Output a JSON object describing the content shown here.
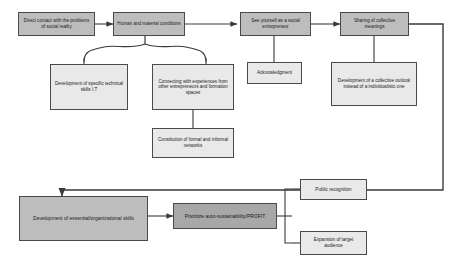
{
  "diagram": {
    "type": "flowchart",
    "colors": {
      "box_fill_gray": "#bdbdbd",
      "box_fill_light": "#e9e9e9",
      "box_fill_dark": "#a8a8a8",
      "border": "#4a4a4a",
      "connector": "#3a3a3a",
      "background": "#ffffff"
    },
    "nodes": {
      "direct_contact": "Direct contact with the problems of social reality",
      "human_material": "Human and material conditions",
      "see_yourself": "See yourself as a social entrepreneur",
      "sharing_meanings": "Sharing of collective meanings",
      "technical_skills": "Development of specific technical skills I.T",
      "connecting_experiences": "Connecting with experiences from other entrepreneurs and formation spaces",
      "acknowledgment": "Acknowledgment",
      "collective_outlook": "Development of a collective outlook instead of a individualistic one",
      "networks": "Constitution of formal and informal networks",
      "organizational_skills": "Development of essential/organizational skills",
      "prioritize": "Prioritize auto-sustainability/PROFIT",
      "public_recognition": "Public recognition",
      "target_audience": "Expansion of target audience"
    },
    "edges": [
      {
        "from": "direct_contact",
        "to": "human_material",
        "style": "arrow-right"
      },
      {
        "from": "human_material",
        "to": "see_yourself",
        "style": "arrow-right"
      },
      {
        "from": "see_yourself",
        "to": "sharing_meanings",
        "style": "arrow-right"
      },
      {
        "from": "human_material",
        "to": "technical_skills",
        "style": "brace-split-down"
      },
      {
        "from": "human_material",
        "to": "connecting_experiences",
        "style": "brace-split-down"
      },
      {
        "from": "see_yourself",
        "to": "acknowledgment",
        "style": "line-down"
      },
      {
        "from": "sharing_meanings",
        "to": "collective_outlook",
        "style": "line-down"
      },
      {
        "from": "connecting_experiences",
        "to": "networks",
        "style": "line-down"
      },
      {
        "from": "sharing_meanings",
        "to": "organizational_skills",
        "style": "route-right-down-left-arrow"
      },
      {
        "from": "organizational_skills",
        "to": "prioritize",
        "style": "arrow-right"
      },
      {
        "from": "prioritize",
        "to": "public_recognition",
        "style": "bracket-split-right"
      },
      {
        "from": "prioritize",
        "to": "target_audience",
        "style": "bracket-split-right"
      }
    ]
  }
}
